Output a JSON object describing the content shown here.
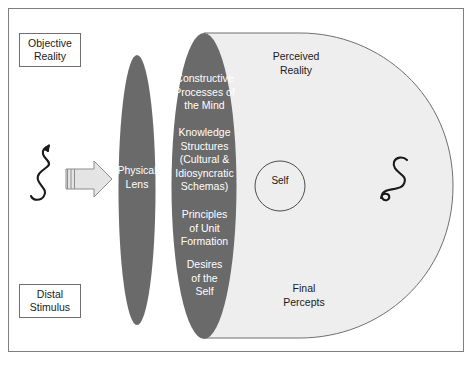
{
  "diagram": {
    "colors": {
      "frame_border": "#7e7e7e",
      "lens_fill": "#6a6a6a",
      "perceived_fill": "#eeeeee",
      "perceived_stroke": "#6f6f6f",
      "arrow_fill": "#e4e4e4",
      "arrow_stroke": "#8d8d8d",
      "text_dark": "#1a1a1a",
      "text_light": "#ffffff",
      "squiggle": "#1a1a1a"
    },
    "labels": {
      "objective_reality": "Objective\nReality",
      "distal_stimulus": "Distal\nStimulus",
      "physical_lens": "Physical\nLens",
      "constructive_processes": "Constructive\nProcesses of\nthe Mind",
      "knowledge_structures": "Knowledge\nStructures\n(Cultural &\nIdiosyncratic\nSchemas)",
      "principles_unit_formation": "Principles\nof Unit\nFormation",
      "desires_of_the_self": "Desires\nof the\nSelf",
      "perceived_reality": "Perceived\nReality",
      "final_percepts": "Final\nPercepts",
      "self": "Self"
    },
    "shapes": {
      "stimulus_squiggle": "squiggle-stimulus-icon",
      "percept_squiggle": "squiggle-percept-icon",
      "light_arrow": "light-ray-arrow-icon",
      "physical_lens_ellipse": "physical-lens-ellipse",
      "mind_lens_ellipse": "mind-lens-ellipse",
      "perceived_reality_region": "perceived-reality-region",
      "self_circle": "self-circle"
    }
  }
}
